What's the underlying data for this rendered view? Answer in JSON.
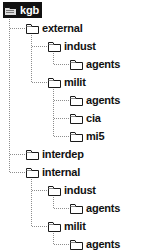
{
  "view": {
    "name": "folder-tree",
    "background": "#ffffff",
    "text_color": "#111111",
    "selection_bg": "#111111",
    "selection_fg": "#ffffff",
    "line_color": "#8d8d8d",
    "row_height": 18,
    "indent": 22
  },
  "tree": {
    "nodes": [
      {
        "id": "kgb",
        "label": "kgb",
        "depth": 0,
        "icon": "folder-open-icon",
        "selected": true,
        "expanded": true,
        "last_child": true,
        "row": 0
      },
      {
        "id": "external",
        "label": "external",
        "depth": 1,
        "icon": "folder-icon",
        "selected": false,
        "expanded": true,
        "last_child": false,
        "row": 1
      },
      {
        "id": "ext-indust",
        "label": "indust",
        "depth": 2,
        "icon": "folder-icon",
        "selected": false,
        "expanded": true,
        "last_child": false,
        "row": 2
      },
      {
        "id": "ext-ind-agents",
        "label": "agents",
        "depth": 3,
        "icon": "folder-icon",
        "selected": false,
        "expanded": false,
        "last_child": true,
        "row": 3
      },
      {
        "id": "ext-milit",
        "label": "milit",
        "depth": 2,
        "icon": "folder-icon",
        "selected": false,
        "expanded": true,
        "last_child": true,
        "row": 4
      },
      {
        "id": "ext-mil-agents",
        "label": "agents",
        "depth": 3,
        "icon": "folder-icon",
        "selected": false,
        "expanded": false,
        "last_child": false,
        "row": 5
      },
      {
        "id": "ext-mil-cia",
        "label": "cia",
        "depth": 3,
        "icon": "folder-icon",
        "selected": false,
        "expanded": false,
        "last_child": false,
        "row": 6
      },
      {
        "id": "ext-mil-mi5",
        "label": "mi5",
        "depth": 3,
        "icon": "folder-icon",
        "selected": false,
        "expanded": false,
        "last_child": true,
        "row": 7
      },
      {
        "id": "interdep",
        "label": "interdep",
        "depth": 1,
        "icon": "folder-icon",
        "selected": false,
        "expanded": false,
        "last_child": false,
        "row": 8
      },
      {
        "id": "internal",
        "label": "internal",
        "depth": 1,
        "icon": "folder-icon",
        "selected": false,
        "expanded": true,
        "last_child": true,
        "row": 9
      },
      {
        "id": "int-indust",
        "label": "indust",
        "depth": 2,
        "icon": "folder-icon",
        "selected": false,
        "expanded": true,
        "last_child": false,
        "row": 10
      },
      {
        "id": "int-ind-agents",
        "label": "agents",
        "depth": 3,
        "icon": "folder-icon",
        "selected": false,
        "expanded": false,
        "last_child": true,
        "row": 11
      },
      {
        "id": "int-milit",
        "label": "milit",
        "depth": 2,
        "icon": "folder-icon",
        "selected": false,
        "expanded": true,
        "last_child": true,
        "row": 12
      },
      {
        "id": "int-mil-agents",
        "label": "agents",
        "depth": 3,
        "icon": "folder-icon",
        "selected": false,
        "expanded": false,
        "last_child": true,
        "row": 13
      }
    ],
    "edges": [
      {
        "parent": "kgb",
        "children": [
          "external",
          "interdep",
          "internal"
        ]
      },
      {
        "parent": "external",
        "children": [
          "ext-indust",
          "ext-milit"
        ]
      },
      {
        "parent": "ext-indust",
        "children": [
          "ext-ind-agents"
        ]
      },
      {
        "parent": "ext-milit",
        "children": [
          "ext-mil-agents",
          "ext-mil-cia",
          "ext-mil-mi5"
        ]
      },
      {
        "parent": "internal",
        "children": [
          "int-indust",
          "int-milit"
        ]
      },
      {
        "parent": "int-indust",
        "children": [
          "int-ind-agents"
        ]
      },
      {
        "parent": "int-milit",
        "children": [
          "int-mil-agents"
        ]
      }
    ]
  }
}
